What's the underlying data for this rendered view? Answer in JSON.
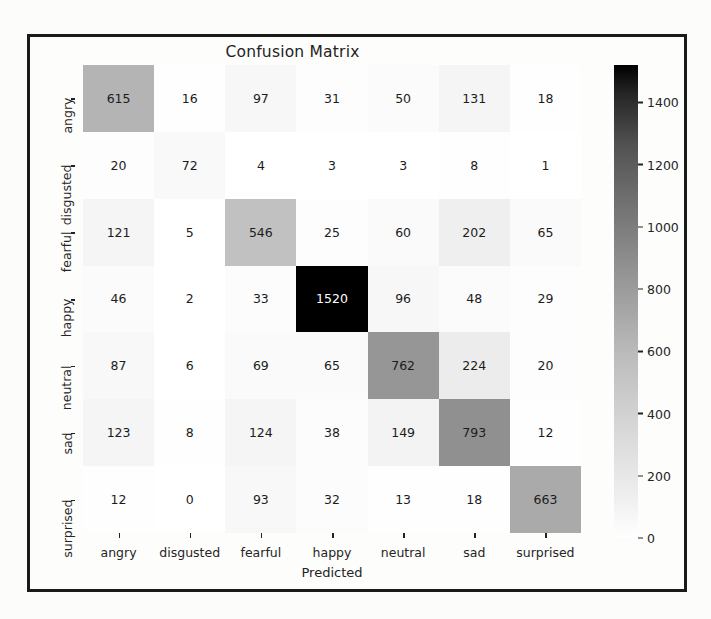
{
  "figure": {
    "title": "Confusion Matrix",
    "xlabel": "Predicted",
    "ylabel": "Actual"
  },
  "chart_data": {
    "type": "heatmap",
    "title": "Confusion Matrix",
    "xlabel": "Predicted",
    "ylabel": "Actual",
    "colormap": "Greys",
    "grid": false,
    "legend_position": "right-colorbar",
    "categories": [
      "angry",
      "disgusted",
      "fearful",
      "happy",
      "neutral",
      "sad",
      "surprised"
    ],
    "x_tick_labels": [
      "angry",
      "disgusted",
      "fearful",
      "happy",
      "neutral",
      "sad",
      "surprised"
    ],
    "y_tick_labels": [
      "angry",
      "disgusted",
      "fearful",
      "happy",
      "neutral",
      "sad",
      "surprised"
    ],
    "colorbar": {
      "ticks": [
        0,
        200,
        400,
        600,
        800,
        1000,
        1200,
        1400
      ],
      "tick_labels": [
        "0",
        "200",
        "400",
        "600",
        "800",
        "1000",
        "1200",
        "1400"
      ],
      "vmin": 0,
      "vmax": 1520
    },
    "matrix": [
      [
        615,
        16,
        97,
        31,
        50,
        131,
        18
      ],
      [
        20,
        72,
        4,
        3,
        3,
        8,
        1
      ],
      [
        121,
        5,
        546,
        25,
        60,
        202,
        65
      ],
      [
        46,
        2,
        33,
        1520,
        96,
        48,
        29
      ],
      [
        87,
        6,
        69,
        65,
        762,
        224,
        20
      ],
      [
        123,
        8,
        124,
        38,
        149,
        793,
        12
      ],
      [
        12,
        0,
        93,
        32,
        13,
        18,
        663
      ]
    ],
    "rows": [
      {
        "label": "angry",
        "values": [
          615,
          16,
          97,
          31,
          50,
          131,
          18
        ]
      },
      {
        "label": "disgusted",
        "values": [
          20,
          72,
          4,
          3,
          3,
          8,
          1
        ]
      },
      {
        "label": "fearful",
        "values": [
          121,
          5,
          546,
          25,
          60,
          202,
          65
        ]
      },
      {
        "label": "happy",
        "values": [
          46,
          2,
          33,
          1520,
          96,
          48,
          29
        ]
      },
      {
        "label": "neutral",
        "values": [
          87,
          6,
          69,
          65,
          762,
          224,
          20
        ]
      },
      {
        "label": "sad",
        "values": [
          123,
          8,
          124,
          38,
          149,
          793,
          12
        ]
      },
      {
        "label": "surprised",
        "values": [
          12,
          0,
          93,
          32,
          13,
          18,
          663
        ]
      }
    ]
  },
  "colors": {
    "frame": "#1a1a1a",
    "text": "#232323",
    "cell_text_dark": "#1c1c1c",
    "cell_text_light": "#ffffff",
    "background": "#fdfdfc"
  }
}
